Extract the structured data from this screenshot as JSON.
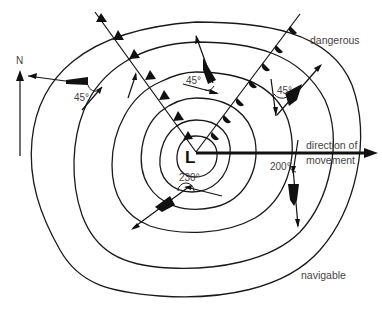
{
  "diagram": {
    "labels": {
      "north": "N",
      "low": "L",
      "direction": "direction of",
      "movement": "movement",
      "dangerous": "dangerous",
      "navigable": "navigable"
    },
    "angles": {
      "upper_left": "45°",
      "upper_center": "45°",
      "upper_right": "45°",
      "lower_center": "230°",
      "lower_right": "200°"
    },
    "elements": {
      "isobars": 6,
      "fronts": [
        "cold-front",
        "warm-front"
      ],
      "ships": 5
    }
  }
}
